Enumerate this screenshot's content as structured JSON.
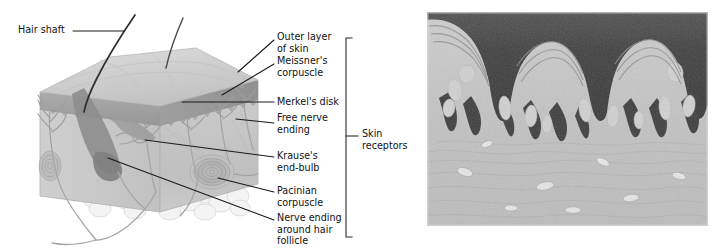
{
  "figure": {
    "background_color": "#ffffff",
    "ink_color": "#111111",
    "leader_line_color": "#1a1a1a"
  },
  "diagram": {
    "name": "skin-cross-section-diagram",
    "hair_shaft_label": "Hair shaft",
    "bracket_label": "Skin\nreceptors",
    "labels": [
      {
        "id": "outer-layer-of-skin",
        "text": "Outer layer\nof skin"
      },
      {
        "id": "meissners-corpuscle",
        "text": "Meissner's\ncorpuscle"
      },
      {
        "id": "merkels-disk",
        "text": "Merkel's disk"
      },
      {
        "id": "free-nerve-ending",
        "text": "Free nerve\nending"
      },
      {
        "id": "krauses-end-bulb",
        "text": "Krause's\nend-bulb"
      },
      {
        "id": "pacinian-corpuscle",
        "text": "Pacinian\ncorpuscle"
      },
      {
        "id": "nerve-ending-around-hair-follicle",
        "text": "Nerve ending\naround hair\nfollicle"
      }
    ],
    "palette": {
      "epidermis_top": "#c6c6c6",
      "epidermis_face": "#9a9a9a",
      "dermis_face": "#bdbdbd",
      "dermis_side": "#a8a8a8",
      "subcutaneous_fat": "#f2f2f2",
      "follicle_dark": "#8b8b8b",
      "nerve_gray": "#9d9d9d",
      "hair_black": "#3a3a3a"
    }
  },
  "photograph": {
    "name": "skin-histology-photomicrograph",
    "palette": {
      "border": "#cfcfcf",
      "epidermis_dark": "#3c3c3c",
      "stratum_corneum": "#575757",
      "dermis_light": "#c4c4c4",
      "papillae_pale": "#d9d9d9",
      "background": "#ffffff"
    }
  }
}
